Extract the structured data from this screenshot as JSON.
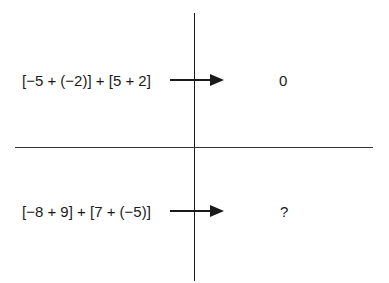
{
  "rows": [
    {
      "expression": "[−5 + (−2)] + [5 + 2]",
      "result": "0"
    },
    {
      "expression": "[−8 + 9] + [7 + (−5)]",
      "result": "?"
    }
  ],
  "colors": {
    "line": "#1a1a1a",
    "text": "#1a1a1a"
  }
}
